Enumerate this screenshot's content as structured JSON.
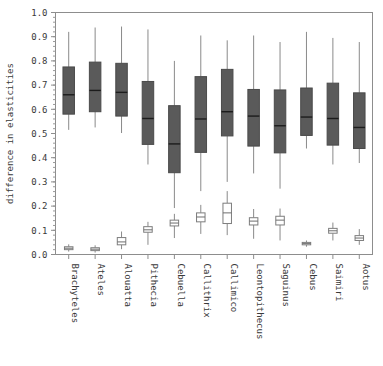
{
  "chart_data": {
    "type": "box",
    "title": "",
    "subtitle": "",
    "xlabel": "",
    "ylabel": "difference in elasticities",
    "ylim": [
      0.0,
      1.0
    ],
    "grid": false,
    "legend": "none",
    "y_ticks": [
      "0.0",
      "0.1",
      "0.2",
      "0.3",
      "0.4",
      "0.5",
      "0.6",
      "0.7",
      "0.8",
      "0.9",
      "1.0"
    ],
    "y_tick_values": [
      0.0,
      0.1,
      0.2,
      0.3,
      0.4,
      0.5,
      0.6,
      0.7,
      0.8,
      0.9,
      1.0
    ],
    "minor_tick_interval": 0.02,
    "categories": [
      "Brachyteles",
      "Ateles",
      "Alouatta",
      "Pithecia",
      "Cebuella",
      "Callithrix",
      "Callimico",
      "Leontopithecus",
      "Saguinus",
      "Cebus",
      "Saimiri",
      "Aotus"
    ],
    "series": [
      {
        "name": "upper-filled",
        "style": "filled-gray",
        "fill_color": "#5a5a5a",
        "boxes": [
          {
            "category": "Brachyteles",
            "whisker_low": 0.515,
            "q1": 0.58,
            "median": 0.66,
            "q3": 0.775,
            "whisker_high": 0.92
          },
          {
            "category": "Ateles",
            "whisker_low": 0.525,
            "q1": 0.59,
            "median": 0.678,
            "q3": 0.795,
            "whisker_high": 0.938
          },
          {
            "category": "Alouatta",
            "whisker_low": 0.502,
            "q1": 0.572,
            "median": 0.67,
            "q3": 0.79,
            "whisker_high": 0.942
          },
          {
            "category": "Pithecia",
            "whisker_low": 0.372,
            "q1": 0.455,
            "median": 0.562,
            "q3": 0.715,
            "whisker_high": 0.93
          },
          {
            "category": "Cebuella",
            "whisker_low": 0.192,
            "q1": 0.338,
            "median": 0.457,
            "q3": 0.615,
            "whisker_high": 0.8
          },
          {
            "category": "Callithrix",
            "whisker_low": 0.262,
            "q1": 0.422,
            "median": 0.56,
            "q3": 0.735,
            "whisker_high": 0.905
          },
          {
            "category": "Callimico",
            "whisker_low": 0.3,
            "q1": 0.49,
            "median": 0.59,
            "q3": 0.765,
            "whisker_high": 0.885
          },
          {
            "category": "Leontopithecus",
            "whisker_low": 0.335,
            "q1": 0.448,
            "median": 0.572,
            "q3": 0.682,
            "whisker_high": 0.905
          },
          {
            "category": "Saguinus",
            "whisker_low": 0.272,
            "q1": 0.42,
            "median": 0.532,
            "q3": 0.68,
            "whisker_high": 0.878
          },
          {
            "category": "Cebus",
            "whisker_low": 0.438,
            "q1": 0.492,
            "median": 0.568,
            "q3": 0.688,
            "whisker_high": 0.92
          },
          {
            "category": "Saimiri",
            "whisker_low": 0.372,
            "q1": 0.452,
            "median": 0.562,
            "q3": 0.708,
            "whisker_high": 0.895
          },
          {
            "category": "Aotus",
            "whisker_low": 0.378,
            "q1": 0.438,
            "median": 0.525,
            "q3": 0.668,
            "whisker_high": 0.878
          }
        ]
      },
      {
        "name": "lower-open",
        "style": "open-white",
        "fill_color": "#ffffff",
        "boxes": [
          {
            "category": "Brachyteles",
            "whisker_low": 0.012,
            "q1": 0.02,
            "median": 0.026,
            "q3": 0.032,
            "whisker_high": 0.042
          },
          {
            "category": "Ateles",
            "whisker_low": 0.008,
            "q1": 0.016,
            "median": 0.022,
            "q3": 0.028,
            "whisker_high": 0.038
          },
          {
            "category": "Alouatta",
            "whisker_low": 0.022,
            "q1": 0.04,
            "median": 0.052,
            "q3": 0.07,
            "whisker_high": 0.095
          },
          {
            "category": "Pithecia",
            "whisker_low": 0.04,
            "q1": 0.092,
            "median": 0.102,
            "q3": 0.115,
            "whisker_high": 0.135
          },
          {
            "category": "Cebuella",
            "whisker_low": 0.068,
            "q1": 0.118,
            "median": 0.13,
            "q3": 0.142,
            "whisker_high": 0.168
          },
          {
            "category": "Callithrix",
            "whisker_low": 0.085,
            "q1": 0.135,
            "median": 0.155,
            "q3": 0.172,
            "whisker_high": 0.205
          },
          {
            "category": "Callimico",
            "whisker_low": 0.08,
            "q1": 0.128,
            "median": 0.172,
            "q3": 0.212,
            "whisker_high": 0.262
          },
          {
            "category": "Leontopithecus",
            "whisker_low": 0.065,
            "q1": 0.122,
            "median": 0.138,
            "q3": 0.152,
            "whisker_high": 0.188
          },
          {
            "category": "Saguinus",
            "whisker_low": 0.058,
            "q1": 0.122,
            "median": 0.142,
            "q3": 0.158,
            "whisker_high": 0.19
          },
          {
            "category": "Cebus",
            "whisker_low": 0.032,
            "q1": 0.04,
            "median": 0.045,
            "q3": 0.05,
            "whisker_high": 0.058
          },
          {
            "category": "Saimiri",
            "whisker_low": 0.058,
            "q1": 0.088,
            "median": 0.098,
            "q3": 0.108,
            "whisker_high": 0.132
          },
          {
            "category": "Aotus",
            "whisker_low": 0.04,
            "q1": 0.058,
            "median": 0.068,
            "q3": 0.078,
            "whisker_high": 0.105
          }
        ]
      }
    ]
  },
  "axes": {
    "y_label": "difference in elasticities"
  }
}
